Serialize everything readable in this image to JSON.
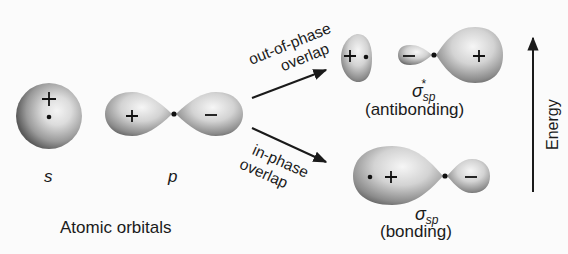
{
  "diagram": {
    "type": "molecular-orbital-formation",
    "atomic_orbitals": {
      "caption": "Atomic orbitals",
      "s": {
        "label": "s",
        "phase_sign": "+"
      },
      "p": {
        "label": "p",
        "left_lobe_sign": "+",
        "right_lobe_sign": "−"
      }
    },
    "arrows": {
      "out_of_phase": {
        "line1": "out-of-phase",
        "line2": "overlap"
      },
      "in_phase": {
        "line1": "in-phase",
        "line2": "overlap"
      }
    },
    "molecular_orbitals": {
      "antibonding": {
        "symbol": "σ",
        "subscript": "sp",
        "superscript": "*",
        "caption": "(antibonding)",
        "left_lobe_sign": "+",
        "middle_lobe_sign": "−",
        "right_lobe_sign": "+"
      },
      "bonding": {
        "symbol": "σ",
        "subscript": "sp",
        "caption": "(bonding)",
        "left_lobe_sign": "+",
        "right_lobe_sign": "−"
      }
    },
    "energy_axis": {
      "label": "Energy",
      "direction": "up"
    }
  }
}
